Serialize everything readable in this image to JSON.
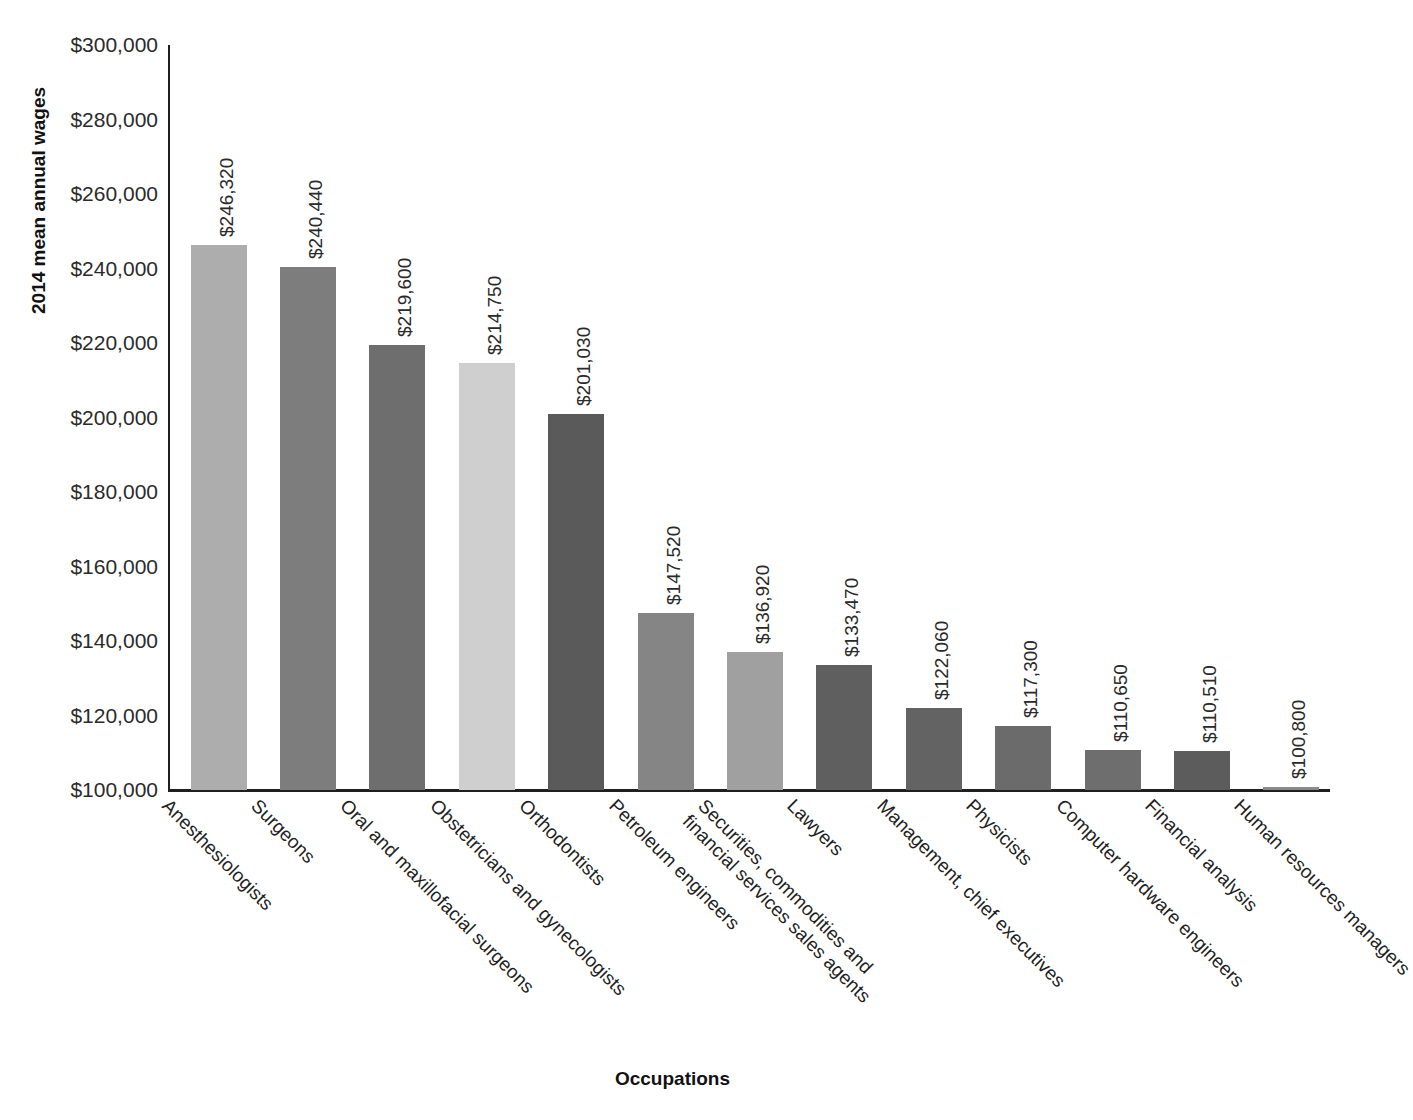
{
  "chart_data": {
    "type": "bar",
    "title": "",
    "xlabel": "Occupations",
    "ylabel": "2014 mean annual wages",
    "ylim": [
      100000,
      300000
    ],
    "ytick_step": 20000,
    "grid": false,
    "legend": "none",
    "value_label_format": "$#,###",
    "value_label_rotation": -90,
    "xtick_label_rotation": 45,
    "categories": [
      "Anesthesiologists",
      "Surgeons",
      "Oral and maxillofacial surgeons",
      "Obstetricians and gynecologists",
      "Orthodontists",
      "Petroleum engineers",
      "Securities, commodities and financial services sales agents",
      "Lawyers",
      "Management, chief executives",
      "Physicists",
      "Computer hardware engineers",
      "Financial analysis",
      "Human resources managers"
    ],
    "category_lines": [
      [
        "Anesthesiologists"
      ],
      [
        "Surgeons"
      ],
      [
        "Oral and maxillofacial surgeons"
      ],
      [
        "Obstetricians and gynecologists"
      ],
      [
        "Orthodontists"
      ],
      [
        "Petroleum engineers"
      ],
      [
        "Securities, commodities and",
        "financial services sales agents"
      ],
      [
        "Lawyers"
      ],
      [
        "Management, chief executives"
      ],
      [
        "Physicists"
      ],
      [
        "Computer hardware engineers"
      ],
      [
        "Financial analysis"
      ],
      [
        "Human resources managers"
      ]
    ],
    "values": [
      246320,
      240440,
      219600,
      214750,
      201030,
      147520,
      136920,
      133470,
      122060,
      117300,
      110650,
      110510,
      100800
    ],
    "value_labels": [
      "$246,320",
      "$240,440",
      "$219,600",
      "$214,750",
      "$201,030",
      "$147,520",
      "$136,920",
      "$133,470",
      "$122,060",
      "$117,300",
      "$110,650",
      "$110,510",
      "$100,800"
    ],
    "bar_colors": [
      "#adadad",
      "#7d7d7d",
      "#6e6e6e",
      "#cfcfcf",
      "#5a5a5a",
      "#858585",
      "#a0a0a0",
      "#5f5f5f",
      "#636363",
      "#6b6b6b",
      "#6e6e6e",
      "#5c5c5c",
      "#8a8a8a"
    ],
    "ytick_labels": [
      "$300,000",
      "$280,000",
      "$260,000",
      "$240,000",
      "$220,000",
      "$200,000",
      "$180,000",
      "$160,000",
      "$140,000",
      "$120,000",
      "$100,000"
    ],
    "ytick_values": [
      300000,
      280000,
      260000,
      240000,
      220000,
      200000,
      180000,
      160000,
      140000,
      120000,
      100000
    ],
    "axis_color": "#1f1f1f",
    "background_color": "#ffffff"
  }
}
